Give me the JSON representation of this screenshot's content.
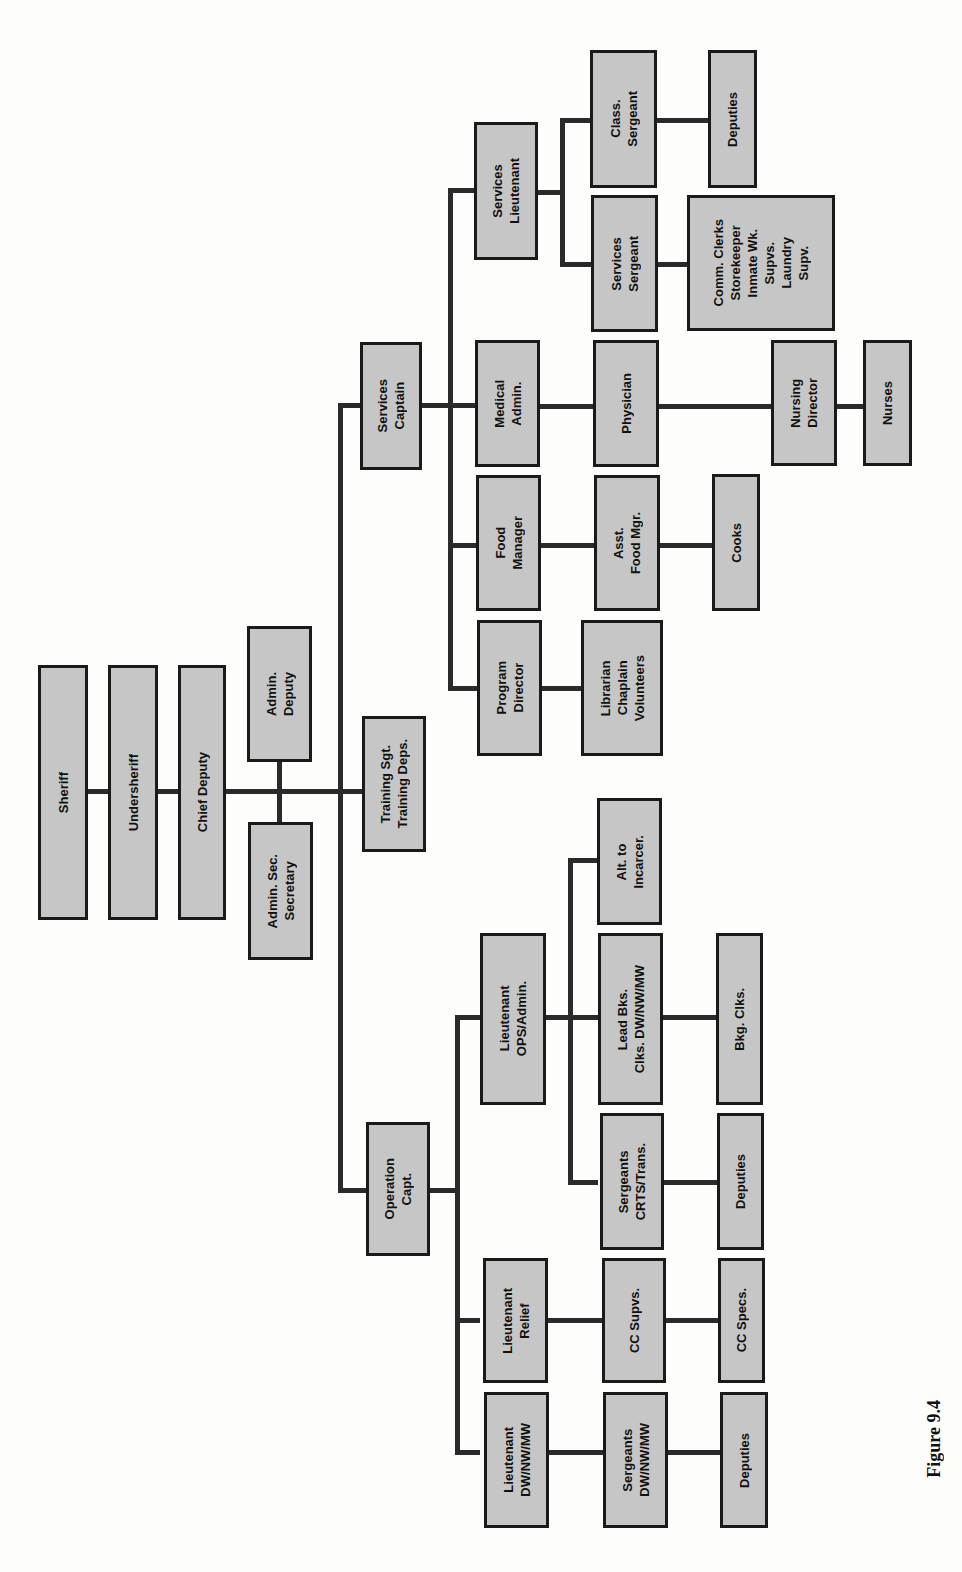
{
  "figure": {
    "caption": "Figure 9.4",
    "orientation": "rotated 90° counter-clockwise (page landscape)",
    "colors": {
      "box_fill": "#c6c6c6",
      "box_border": "#1a1a1a",
      "connector": "#2a2a2a"
    }
  },
  "nodes": {
    "sheriff": "Sheriff",
    "undersheriff": "Undersheriff",
    "chief_deputy": "Chief Deputy",
    "admin_deputy": "Admin.\nDeputy",
    "admin_sec": "Admin. Sec.\nSecretary",
    "training": "Training Sgt.\nTraining Deps.",
    "services_captain": "Services\nCaptain",
    "operation_capt": "Operation\nCapt.",
    "services_lieutenant": "Services\nLieutenant",
    "class_sergeant": "Class.\nSergeant",
    "class_deputies": "Deputies",
    "services_sergeant": "Services\nSergeant",
    "comm_clerks": "Comm. Clerks\nStorekeeper\nInmate Wk.\nSupvs.\nLaundry\nSupv.",
    "medical_admin": "Medical\nAdmin.",
    "physician": "Physician",
    "nursing_director": "Nursing\nDirector",
    "nurses": "Nurses",
    "food_manager": "Food\nManager",
    "asst_food_mgr": "Asst.\nFood Mgr.",
    "cooks": "Cooks",
    "program_director": "Program\nDirector",
    "librarian": "Librarian\nChaplain\nVolunteers",
    "lt_ops_admin": "Lieutenant\nOPS/Admin.",
    "alt_incarcer": "Alt. to\nIncarcer.",
    "lead_bkg": "Lead Bks.\nClks. DW/NW/MW",
    "bkg_clks": "Bkg. Clks.",
    "sgt_crts": "Sergeants\nCRTS/Trans.",
    "crts_deputies": "Deputies",
    "lt_relief": "Lieutenant\nRelief",
    "cc_supvs": "CC Supvs.",
    "cc_specs": "CC Specs.",
    "lt_dw": "Lieutenant\nDW/NW/MW",
    "sgt_dw": "Sergeants\nDW/NW/MW",
    "dw_deputies": "Deputies"
  },
  "hierarchy": [
    {
      "name": "Sheriff",
      "children": [
        {
          "name": "Undersheriff",
          "children": [
            {
              "name": "Chief Deputy",
              "children": [
                {
                  "name": "Admin. Deputy"
                },
                {
                  "name": "Admin. Sec. Secretary"
                },
                {
                  "name": "Training Sgt. Training Deps."
                },
                {
                  "name": "Services Captain",
                  "children": [
                    {
                      "name": "Services Lieutenant",
                      "children": [
                        {
                          "name": "Class. Sergeant",
                          "children": [
                            {
                              "name": "Deputies"
                            }
                          ]
                        },
                        {
                          "name": "Services Sergeant",
                          "children": [
                            {
                              "name": "Comm. Clerks / Storekeeper / Inmate Wk. Supvs. / Laundry Supv."
                            }
                          ]
                        }
                      ]
                    },
                    {
                      "name": "Medical Admin.",
                      "children": [
                        {
                          "name": "Physician",
                          "children": [
                            {
                              "name": "Nursing Director",
                              "children": [
                                {
                                  "name": "Nurses"
                                }
                              ]
                            }
                          ]
                        }
                      ]
                    },
                    {
                      "name": "Food Manager",
                      "children": [
                        {
                          "name": "Asst. Food Mgr.",
                          "children": [
                            {
                              "name": "Cooks"
                            }
                          ]
                        }
                      ]
                    },
                    {
                      "name": "Program Director",
                      "children": [
                        {
                          "name": "Librarian / Chaplain / Volunteers"
                        }
                      ]
                    }
                  ]
                },
                {
                  "name": "Operation Capt.",
                  "children": [
                    {
                      "name": "Lieutenant OPS/Admin.",
                      "children": [
                        {
                          "name": "Alt. to Incarcer."
                        },
                        {
                          "name": "Lead Bks. Clks. DW/NW/MW",
                          "children": [
                            {
                              "name": "Bkg. Clks."
                            }
                          ]
                        },
                        {
                          "name": "Sergeants CRTS/Trans.",
                          "children": [
                            {
                              "name": "Deputies"
                            }
                          ]
                        }
                      ]
                    },
                    {
                      "name": "Lieutenant Relief",
                      "children": [
                        {
                          "name": "CC Supvs.",
                          "children": [
                            {
                              "name": "CC Specs."
                            }
                          ]
                        }
                      ]
                    },
                    {
                      "name": "Lieutenant DW/NW/MW",
                      "children": [
                        {
                          "name": "Sergeants DW/NW/MW",
                          "children": [
                            {
                              "name": "Deputies"
                            }
                          ]
                        }
                      ]
                    }
                  ]
                }
              ]
            }
          ]
        }
      ]
    }
  ]
}
